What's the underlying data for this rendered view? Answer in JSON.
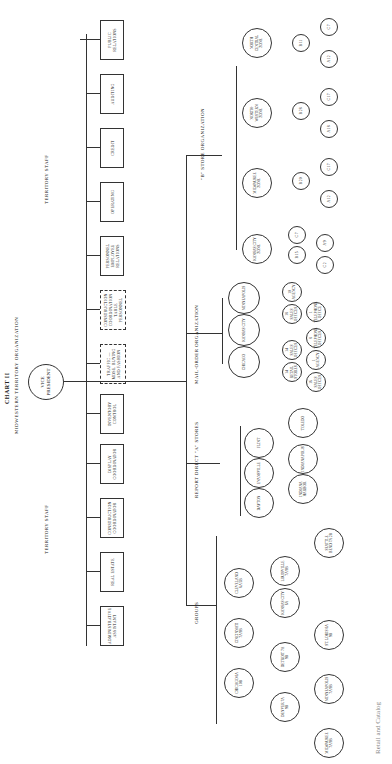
{
  "chart": {
    "title": "CHART II",
    "subtitle": "Midwestern Territory Organization",
    "root": "Vice President"
  },
  "territory_staff": {
    "label": "Territory Staff",
    "units": [
      {
        "label": "Administrative Assistant",
        "style": "solid"
      },
      {
        "label": "Real Estate",
        "style": "solid"
      },
      {
        "label": "Construction Coordinator",
        "style": "solid"
      },
      {
        "label": "Display Coordinator",
        "style": "solid"
      },
      {
        "label": "Inventory Control",
        "style": "solid"
      },
      {
        "label": "Traffic — Mdse. Buying and Fashion",
        "style": "dashed"
      },
      {
        "label": "Construction Coordination Table Personnel",
        "style": "dashed"
      },
      {
        "label": "Personnel Employee Relations",
        "style": "solid"
      },
      {
        "label": "Operating",
        "style": "solid"
      },
      {
        "label": "Credit",
        "style": "solid"
      },
      {
        "label": "Auditing",
        "style": "solid"
      },
      {
        "label": "Public Relations",
        "style": "solid"
      }
    ]
  },
  "groups": {
    "label": "Groups",
    "level1": [
      {
        "label": "Chicago 6A 10B"
      },
      {
        "label": "Cincinnati 7A 9B"
      },
      {
        "label": "Cleveland 6A 5B"
      }
    ],
    "level2": [
      {
        "label": "Denver 7A 9B"
      },
      {
        "label": "Detroit 7A 9B"
      },
      {
        "label": "Kansas City 6A"
      },
      {
        "label": "Louisville 7A 9B"
      }
    ],
    "level3": [
      {
        "label": "Milwaukee 7A 9B"
      },
      {
        "label": "Minneapolis 7A 9B"
      },
      {
        "label": "St. Louis 6A 9B"
      },
      {
        "label": "Seattle Bend 7A 2B"
      }
    ]
  },
  "a_stores": {
    "label": "Report Direct \"A\" Stores",
    "level1": [
      {
        "label": "Dayton"
      },
      {
        "label": "Evansville"
      },
      {
        "label": "Flint"
      }
    ],
    "level2": [
      {
        "label": "Indiana Harbor"
      },
      {
        "label": "Indianapolis"
      },
      {
        "label": "Toledo"
      }
    ]
  },
  "mail_order": {
    "label": "Mail-Order Organization",
    "centers": [
      {
        "label": "Chicago",
        "subs": [
          {
            "label": "14 Retail Stores"
          },
          {
            "label": "8 Catalog Stores"
          },
          {
            "label": "1 Agency"
          },
          {
            "label": "16 Sales Offices"
          }
        ]
      },
      {
        "label": "Kansas City",
        "subs": [
          {
            "label": "14 Sales Offices"
          },
          {
            "label": "8 Telephone Offices"
          }
        ]
      },
      {
        "label": "Minneapolis",
        "subs": [
          {
            "label": "18 Sales Offices"
          },
          {
            "label": "10 Agency"
          },
          {
            "label": "1 Telephone Office"
          }
        ]
      }
    ]
  },
  "b_stores": {
    "label": "\"B\" Store Organization",
    "zones": [
      {
        "label": "Kansas City Zone",
        "subs": [
          {
            "label": "C 7"
          },
          {
            "label": "B 15"
          },
          {
            "label": "A 9"
          },
          {
            "label": "C 2"
          }
        ]
      },
      {
        "label": "Milwaukee Zone",
        "subs": [
          {
            "label": "B 20"
          },
          {
            "label": "C 17"
          },
          {
            "label": "A 12"
          }
        ]
      },
      {
        "label": "North-western Zone",
        "subs": [
          {
            "label": "B 28"
          },
          {
            "label": "C 17"
          },
          {
            "label": "A 18"
          }
        ]
      },
      {
        "label": "North Central Zone",
        "subs": [
          {
            "label": "B 11"
          },
          {
            "label": "C 7"
          },
          {
            "label": "A 12"
          }
        ]
      }
    ]
  },
  "footer": {
    "text": "Retail and Catalog"
  }
}
